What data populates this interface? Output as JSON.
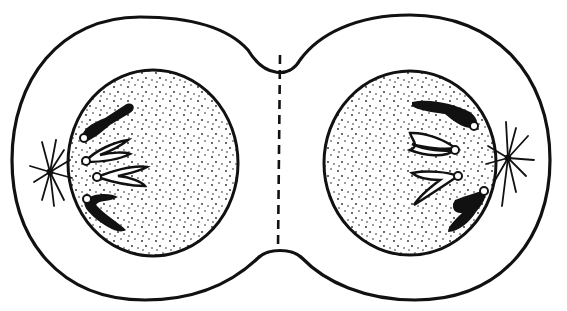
{
  "diagram": {
    "colors": {
      "stroke": "#111111",
      "fill": "#ffffff",
      "chromosome_solid": "#111111",
      "stipple": "#222222"
    },
    "cell_membrane": {
      "left_lobe_center": [
        140,
        160
      ],
      "right_lobe_center": [
        415,
        160
      ],
      "pinch_x": 280
    },
    "cleavage_line": {
      "x": 280,
      "y1": 55,
      "y2": 248,
      "style": "dashed"
    },
    "left_nucleus": {
      "cx": 153,
      "cy": 163,
      "rx": 85,
      "ry": 93
    },
    "right_nucleus": {
      "cx": 410,
      "cy": 163,
      "rx": 86,
      "ry": 92
    },
    "left_aster": {
      "cx": 50,
      "cy": 172
    },
    "right_aster": {
      "cx": 508,
      "cy": 158
    },
    "chromosomes_per_side": 4
  }
}
